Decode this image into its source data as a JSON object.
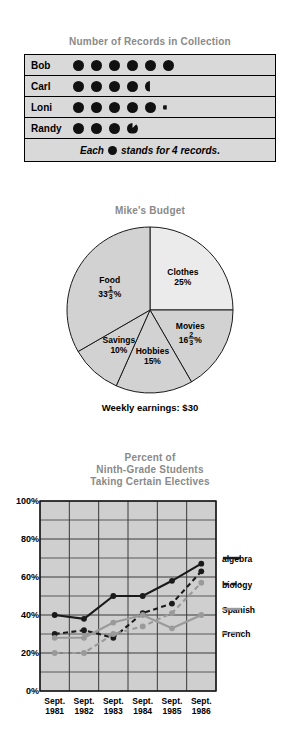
{
  "pictograph": {
    "title": "Number of Records in Collection",
    "rows": [
      {
        "name": "Bob",
        "full": 6,
        "partial": "none"
      },
      {
        "name": "Carl",
        "full": 4,
        "partial": "half-left"
      },
      {
        "name": "Loni",
        "full": 5,
        "partial": "sliver"
      },
      {
        "name": "Randy",
        "full": 3,
        "partial": "three-quarter"
      }
    ],
    "key_prefix": "Each",
    "key_suffix": "stands for 4 records."
  },
  "pie": {
    "title": "Mike's Budget",
    "footer": "Weekly earnings: $30",
    "slices": [
      {
        "label": "Clothes",
        "value": 25,
        "value_text": "25%",
        "whole": "25",
        "num": "",
        "den": "",
        "color": "#ebebeb"
      },
      {
        "label": "Movies",
        "value": 16.6667,
        "value_text": "16 2/3 %",
        "whole": "16",
        "num": "2",
        "den": "3",
        "color": "#d2d2d2"
      },
      {
        "label": "Hobbies",
        "value": 15,
        "value_text": "15%",
        "whole": "15",
        "num": "",
        "den": "",
        "color": "#d2d2d2"
      },
      {
        "label": "Savings",
        "value": 10,
        "value_text": "10%",
        "whole": "10",
        "num": "",
        "den": "",
        "color": "#d2d2d2"
      },
      {
        "label": "Food",
        "value": 33.3333,
        "value_text": "33 1/3 %",
        "whole": "33",
        "num": "1",
        "den": "3",
        "color": "#d2d2d2"
      }
    ]
  },
  "chart_data": {
    "type": "line",
    "title": "Percent of\nNinth-Grade Students\nTaking Certain Electives",
    "title_lines": [
      "Percent of",
      "Ninth-Grade Students",
      "Taking Certain Electives"
    ],
    "xlabel": "",
    "ylabel": "",
    "ylim": [
      0,
      100
    ],
    "yticks": [
      0,
      20,
      40,
      60,
      80,
      100
    ],
    "ytick_labels": [
      "0%",
      "20%",
      "40%",
      "60%",
      "80%",
      "100%"
    ],
    "grid": true,
    "legend_position": "right",
    "categories": [
      "Sept. 1981",
      "Sept. 1982",
      "Sept. 1983",
      "Sept. 1984",
      "Sept. 1985",
      "Sept. 1986"
    ],
    "category_lines": [
      [
        "Sept.",
        "1981"
      ],
      [
        "Sept.",
        "1982"
      ],
      [
        "Sept.",
        "1983"
      ],
      [
        "Sept.",
        "1984"
      ],
      [
        "Sept.",
        "1985"
      ],
      [
        "Sept.",
        "1986"
      ]
    ],
    "series": [
      {
        "name": "algebra",
        "color": "#1a1a1a",
        "dash": "none",
        "values": [
          40,
          38,
          50,
          50,
          58,
          67
        ]
      },
      {
        "name": "biology",
        "color": "#1a1a1a",
        "dash": "dash",
        "values": [
          30,
          32,
          28,
          41,
          46,
          63
        ]
      },
      {
        "name": "Spanish",
        "color": "#9a9a9a",
        "dash": "none",
        "values": [
          28,
          28,
          36,
          40,
          33,
          40
        ]
      },
      {
        "name": "French",
        "color": "#9a9a9a",
        "dash": "dash",
        "values": [
          20,
          20,
          30,
          34,
          41,
          57
        ]
      }
    ]
  }
}
